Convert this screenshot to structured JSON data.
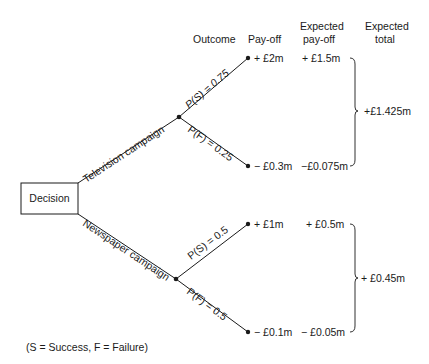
{
  "headers": {
    "outcome": "Outcome",
    "payoff": "Pay-off",
    "expected_payoff_line1": "Expected",
    "expected_payoff_line2": "pay-off",
    "expected_total_line1": "Expected",
    "expected_total_line2": "total"
  },
  "decision_node": {
    "label": "Decision"
  },
  "branches": [
    {
      "label": "Television campaign",
      "outcomes": [
        {
          "prob_label": "P(S) = 0.75",
          "payoff": "+ £2m",
          "expected_payoff": "+ £1.5m"
        },
        {
          "prob_label": "P(F) = 0.25",
          "payoff": "− £0.3m",
          "expected_payoff": "−£0.075m"
        }
      ],
      "expected_total": "+£1.425m"
    },
    {
      "label": "Newspaper campaign",
      "outcomes": [
        {
          "prob_label": "P(S) = 0.5",
          "payoff": "+ £1m",
          "expected_payoff": "+ £0.5m"
        },
        {
          "prob_label": "P(F) = 0.5",
          "payoff": "− £0.1m",
          "expected_payoff": "− £0.05m"
        }
      ],
      "expected_total": "+ £0.45m"
    }
  ],
  "legend": "(S = Success, F = Failure)"
}
